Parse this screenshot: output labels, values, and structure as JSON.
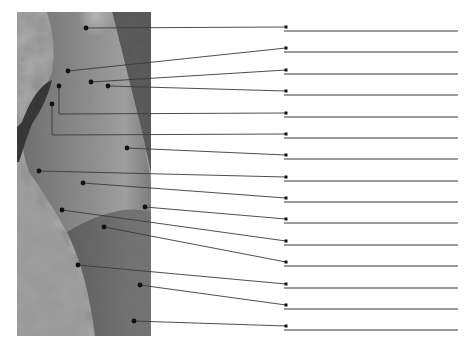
{
  "figure": {
    "type": "anatomical-labeling-diagram",
    "photo": {
      "x": 17,
      "y": 12,
      "width": 134,
      "height": 324
    },
    "label_line": {
      "x_start": 284,
      "x_end": 458,
      "color": "#7a7a7a"
    },
    "leader_color": "#3a3a3a",
    "dot_color": "#111111"
  },
  "labels": [
    {
      "id": 1,
      "text": "",
      "row_y": 27,
      "dot": [
        86,
        28
      ],
      "elbow": null
    },
    {
      "id": 2,
      "text": "",
      "row_y": 48,
      "dot": [
        68,
        71
      ],
      "elbow": null
    },
    {
      "id": 3,
      "text": "",
      "row_y": 70,
      "dot": [
        91,
        82
      ],
      "elbow": null
    },
    {
      "id": 4,
      "text": "",
      "row_y": 91,
      "dot": [
        108,
        86
      ],
      "elbow": null
    },
    {
      "id": 5,
      "text": "",
      "row_y": 113,
      "dot": [
        59,
        86
      ],
      "elbow": [
        59,
        114
      ]
    },
    {
      "id": 6,
      "text": "",
      "row_y": 134,
      "dot": [
        52,
        104
      ],
      "elbow": [
        52,
        135
      ]
    },
    {
      "id": 7,
      "text": "",
      "row_y": 155,
      "dot": [
        127,
        148
      ],
      "elbow": null
    },
    {
      "id": 8,
      "text": "",
      "row_y": 177,
      "dot": [
        39,
        171
      ],
      "elbow": null
    },
    {
      "id": 9,
      "text": "",
      "row_y": 198,
      "dot": [
        83,
        183
      ],
      "elbow": null
    },
    {
      "id": 10,
      "text": "",
      "row_y": 219,
      "dot": [
        145,
        207
      ],
      "elbow": null
    },
    {
      "id": 11,
      "text": "",
      "row_y": 241,
      "dot": [
        62,
        210
      ],
      "elbow": null
    },
    {
      "id": 12,
      "text": "",
      "row_y": 262,
      "dot": [
        104,
        227
      ],
      "elbow": null
    },
    {
      "id": 13,
      "text": "",
      "row_y": 284,
      "dot": [
        78,
        265
      ],
      "elbow": null
    },
    {
      "id": 14,
      "text": "",
      "row_y": 305,
      "dot": [
        140,
        285
      ],
      "elbow": null
    },
    {
      "id": 15,
      "text": "",
      "row_y": 326,
      "dot": [
        134,
        321
      ],
      "elbow": null
    }
  ]
}
